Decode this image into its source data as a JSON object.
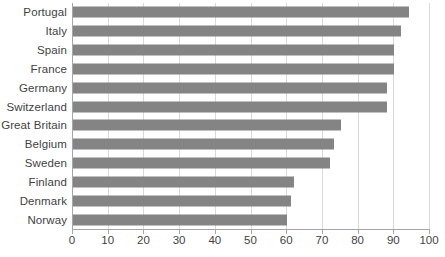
{
  "chart_data": {
    "type": "bar",
    "orientation": "horizontal",
    "title": "",
    "subtitle": "",
    "xlabel": "",
    "ylabel": "",
    "xlim": [
      0,
      100
    ],
    "xticks": [
      0,
      10,
      20,
      30,
      40,
      50,
      60,
      70,
      80,
      90,
      100
    ],
    "grid": true,
    "legend": false,
    "bar_color": "#848484",
    "gridline_color": "#d9d9d9",
    "axis_color": "#a6a6a6",
    "label_color": "#3f3f3f",
    "categories": [
      "Portugal",
      "Italy",
      "Spain",
      "France",
      "Germany",
      "Switzerland",
      "Great Britain",
      "Belgium",
      "Sweden",
      "Finland",
      "Denmark",
      "Norway"
    ],
    "values": [
      94,
      92,
      90,
      90,
      88,
      88,
      75,
      73,
      72,
      62,
      61,
      60
    ]
  }
}
